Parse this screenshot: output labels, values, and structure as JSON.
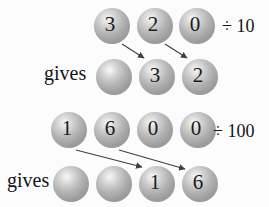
{
  "diagram_title": "place-value shift when dividing by 10 and 100",
  "colors": {
    "background": "#fcfcfc",
    "sphere_gray": "#9e9e9e",
    "sphere_highlight": "#f8f8f8",
    "digit": "#1b1b1b",
    "label_text": "#141414",
    "arrow": "#3f3f3f"
  },
  "section1": {
    "operation_label": "÷ 10",
    "gives_label": "gives",
    "top_digits": [
      "3",
      "2",
      "0"
    ],
    "result_digits": [
      "",
      "3",
      "2"
    ],
    "arrow_mappings": [
      {
        "from": "top_digits.0",
        "to": "result_digits.1"
      },
      {
        "from": "top_digits.1",
        "to": "result_digits.2"
      }
    ]
  },
  "section2": {
    "operation_label": "÷ 100",
    "gives_label": "gives",
    "top_digits": [
      "1",
      "6",
      "0",
      "0"
    ],
    "result_digits": [
      "",
      "",
      "1",
      "6"
    ],
    "arrow_mappings": [
      {
        "from": "top_digits.0",
        "to": "result_digits.2"
      },
      {
        "from": "top_digits.1",
        "to": "result_digits.3"
      }
    ]
  }
}
